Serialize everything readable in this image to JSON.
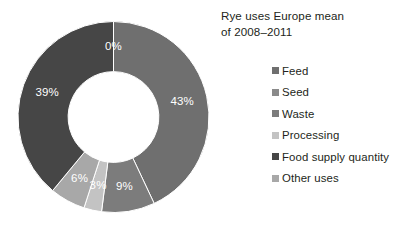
{
  "title": {
    "line1": "Rye uses Europe mean",
    "line2": "of 2008–2011"
  },
  "chart_data": {
    "type": "pie",
    "variant": "donut",
    "title": "Rye uses Europe mean of 2008–2011",
    "xlabel": "",
    "ylabel": "",
    "units": "percent",
    "total": 100,
    "start_angle_deg": 0,
    "direction": "clockwise",
    "inner_radius_ratio": 0.475,
    "legend_position": "right",
    "grid": false,
    "categories": [
      "Feed",
      "Seed",
      "Waste",
      "Processing",
      "Food supply quantity",
      "Other uses"
    ],
    "values": [
      43,
      0,
      9,
      3,
      39,
      6
    ],
    "labels": [
      "43%",
      "0%",
      "9%",
      "3%",
      "39%",
      "6%"
    ],
    "colors": [
      "#6f6f6f",
      "#8a8a8a",
      "#7c7c7c",
      "#c3c3c3",
      "#464646",
      "#a8a8a8"
    ],
    "slice_order_clockwise": [
      "Feed",
      "Waste",
      "Processing",
      "Other uses",
      "Food supply quantity",
      "Seed"
    ],
    "series": [
      {
        "name": "Rye uses Europe mean of 2008–2011",
        "points": [
          {
            "category": "Feed",
            "value": 43,
            "label": "43%",
            "color": "#6f6f6f"
          },
          {
            "category": "Seed",
            "value": 0,
            "label": "0%",
            "color": "#8a8a8a"
          },
          {
            "category": "Waste",
            "value": 9,
            "label": "9%",
            "color": "#7c7c7c"
          },
          {
            "category": "Processing",
            "value": 3,
            "label": "3%",
            "color": "#c3c3c3"
          },
          {
            "category": "Food supply quantity",
            "value": 39,
            "label": "39%",
            "color": "#464646"
          },
          {
            "category": "Other uses",
            "value": 6,
            "label": "6%",
            "color": "#a8a8a8"
          }
        ]
      }
    ]
  },
  "legend": {
    "items": [
      {
        "label": "Feed",
        "color": "#6f6f6f"
      },
      {
        "label": "Seed",
        "color": "#8a8a8a"
      },
      {
        "label": "Waste",
        "color": "#7c7c7c"
      },
      {
        "label": "Processing",
        "color": "#c3c3c3"
      },
      {
        "label": "Food supply quantity",
        "color": "#464646"
      },
      {
        "label": "Other uses",
        "color": "#a8a8a8"
      }
    ]
  }
}
